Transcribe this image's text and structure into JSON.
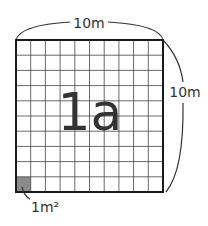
{
  "diagram": {
    "grid": {
      "rows": 10,
      "cols": 10,
      "shaded_cell": {
        "row": 9,
        "col": 0
      }
    },
    "labels": {
      "top_side": "10m",
      "right_side": "10m",
      "center": "1a",
      "unit_cell": "1m²"
    },
    "colors": {
      "grid_line": "#444444",
      "border": "#1a1a1a",
      "shaded": "#8a8a8a",
      "text": "#333333"
    }
  }
}
